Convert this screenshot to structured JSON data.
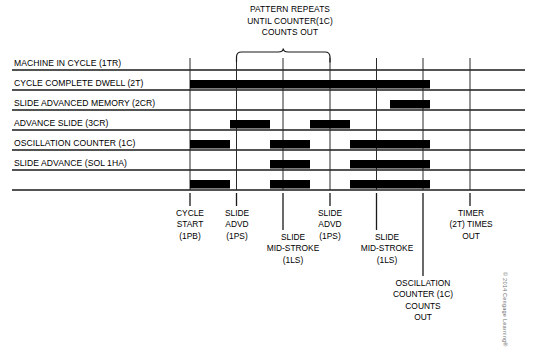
{
  "figure": {
    "type": "timing-diagram",
    "title_note": {
      "lines": [
        "PATTERN REPEATS",
        "UNTIL COUNTER(1C)",
        "COUNTS OUT"
      ]
    },
    "credit": "© 2014 Cengage Learning®"
  },
  "axis": {
    "columns": 8,
    "grid_line_x": [
      190,
      236.5,
      283,
      330,
      376.5,
      423,
      470
    ],
    "plot_left": 190,
    "plot_right": 470,
    "label_rule_left": 12,
    "label_rule_right": 525,
    "row_height": 20,
    "first_row_top": 70
  },
  "signals": [
    {
      "name": "MACHINE IN CYCLE (1TR)",
      "id": "1TR",
      "segments": [
        {
          "from": 0,
          "to": 6,
          "state": "high"
        },
        {
          "from": 6,
          "to": 7,
          "state": "low"
        }
      ]
    },
    {
      "name": "CYCLE COMPLETE DWELL (2T)",
      "id": "2T",
      "segments": [
        {
          "from": 0,
          "to": 5,
          "state": "low"
        },
        {
          "from": 5,
          "to": 6,
          "state": "high"
        },
        {
          "from": 6,
          "to": 7,
          "state": "low"
        }
      ]
    },
    {
      "name": "SLIDE ADVANCED MEMORY (2CR)",
      "id": "2CR",
      "segments": [
        {
          "from": 0,
          "to": 1,
          "state": "low"
        },
        {
          "from": 1,
          "to": 2,
          "state": "high"
        },
        {
          "from": 2,
          "to": 3,
          "state": "low"
        },
        {
          "from": 3,
          "to": 4,
          "state": "high"
        },
        {
          "from": 4,
          "to": 7,
          "state": "low"
        }
      ]
    },
    {
      "name": "ADVANCE SLIDE (3CR)",
      "id": "3CR",
      "segments": [
        {
          "from": 0,
          "to": 1,
          "state": "high"
        },
        {
          "from": 1,
          "to": 2,
          "state": "low"
        },
        {
          "from": 2,
          "to": 3,
          "state": "high"
        },
        {
          "from": 3,
          "to": 4,
          "state": "low"
        },
        {
          "from": 4,
          "to": 6,
          "state": "high"
        },
        {
          "from": 6,
          "to": 7,
          "state": "low"
        }
      ]
    },
    {
      "name": "OSCILLATION COUNTER (1C)",
      "id": "1C",
      "segments": [
        {
          "from": 0,
          "to": 2,
          "state": "low"
        },
        {
          "from": 2,
          "to": 3,
          "state": "high"
        },
        {
          "from": 3,
          "to": 4,
          "state": "low"
        },
        {
          "from": 4,
          "to": 6,
          "state": "high"
        },
        {
          "from": 6,
          "to": 7,
          "state": "low"
        }
      ]
    },
    {
      "name": "SLIDE ADVANCE (SOL 1HA)",
      "id": "SOL 1HA",
      "segments": [
        {
          "from": 0,
          "to": 1,
          "state": "high"
        },
        {
          "from": 1,
          "to": 2,
          "state": "low"
        },
        {
          "from": 2,
          "to": 3,
          "state": "high"
        },
        {
          "from": 3,
          "to": 4,
          "state": "low"
        },
        {
          "from": 4,
          "to": 6,
          "state": "high"
        },
        {
          "from": 6,
          "to": 7,
          "state": "low"
        }
      ]
    }
  ],
  "brace": {
    "from_x": 236.5,
    "to_x": 330,
    "top_y": 52,
    "bottom_y": 62
  },
  "events": [
    {
      "tick_x": 190,
      "lines": [
        "CYCLE",
        "START",
        "(1PB)"
      ],
      "left": 158,
      "top": 208,
      "width": 64,
      "tick_top": 193,
      "tick_bottom": 206
    },
    {
      "tick_x": 236.5,
      "lines": [
        "SLIDE",
        "ADVD",
        "(1PS)"
      ],
      "left": 206,
      "top": 208,
      "width": 62,
      "tick_top": 193,
      "tick_bottom": 206
    },
    {
      "tick_x": 283,
      "lines": [
        "SLIDE",
        "MID-STROKE",
        "(1LS)"
      ],
      "left": 246,
      "top": 232,
      "width": 94,
      "tick_top": 193,
      "tick_bottom": 230
    },
    {
      "tick_x": 330,
      "lines": [
        "SLIDE",
        "ADVD",
        "(1PS)"
      ],
      "left": 299,
      "top": 208,
      "width": 62,
      "tick_top": 193,
      "tick_bottom": 206
    },
    {
      "tick_x": 376.5,
      "lines": [
        "SLIDE",
        "MID-STROKE",
        "(1LS)"
      ],
      "left": 340,
      "top": 232,
      "width": 94,
      "tick_top": 193,
      "tick_bottom": 230
    },
    {
      "tick_x": 423,
      "lines": [
        "OSCILLATION",
        "COUNTER (1C)",
        "COUNTS",
        "OUT"
      ],
      "left": 371,
      "top": 278,
      "width": 104,
      "tick_top": 193,
      "tick_bottom": 276
    },
    {
      "tick_x": 470,
      "lines": [
        "TIMER",
        "(2T) TIMES",
        "OUT"
      ],
      "left": 432,
      "top": 208,
      "width": 78,
      "tick_top": 193,
      "tick_bottom": 206
    }
  ],
  "colors": {
    "signal_fill": "#000000",
    "rule": "#1a1a1a",
    "grid": "#2b2b2b",
    "background": "#ffffff",
    "credit_text": "#6f6f6f"
  }
}
